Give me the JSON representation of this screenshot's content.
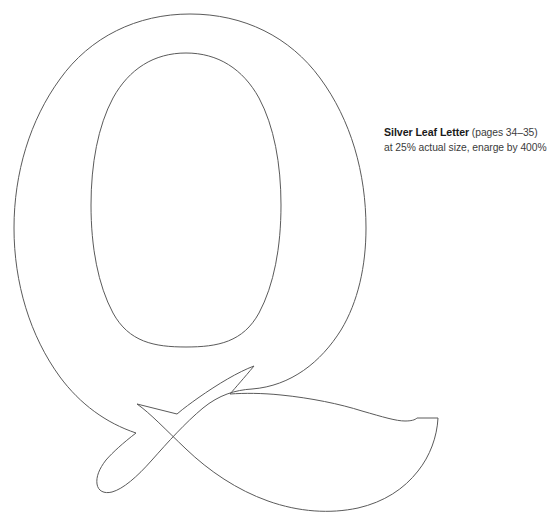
{
  "page": {
    "background_color": "#ffffff",
    "width": 554,
    "height": 520
  },
  "artwork": {
    "name": "letter-q-outline-template",
    "glyph": "Q",
    "style": "serif-didone-outline",
    "stroke_color": "#5a5a5a",
    "fill_color": "none",
    "description": "Outline template of the capital letter Q with an extended swash tail"
  },
  "caption": {
    "title": "Silver Leaf Letter",
    "pages": "(pages 34–35)",
    "subtitle": "at 25% actual size, enarge by 400%",
    "text_color": "#231f20"
  }
}
